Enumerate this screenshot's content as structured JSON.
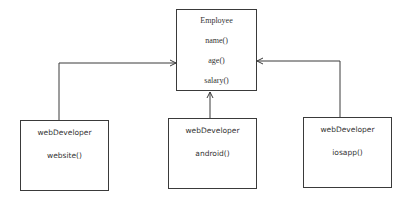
{
  "diagram": {
    "parent": {
      "title": "Employee",
      "methods": [
        "name()",
        "age()",
        "salary()"
      ]
    },
    "children": [
      {
        "title": "webDeveloper",
        "method": "website()"
      },
      {
        "title": "webDeveloper",
        "method": "android()"
      },
      {
        "title": "webDeveloper",
        "method": "iosapp()"
      }
    ],
    "line_color": "#3a3a3a"
  }
}
